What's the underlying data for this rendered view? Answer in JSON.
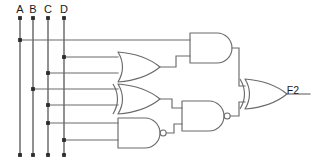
{
  "diagram": {
    "background_color": "#ffffff",
    "wire_color": "#6b6b6b",
    "bus_color": "#5c5c5c",
    "junction_color": "#2b2b2b",
    "text_color": "#1a1a1a"
  },
  "inputs": [
    {
      "label": "A",
      "x": 20,
      "label_x": 20,
      "label_y": 13,
      "top_y": 18,
      "bottom_y": 155
    },
    {
      "label": "B",
      "x": 33,
      "label_x": 33,
      "label_y": 13,
      "top_y": 18,
      "bottom_y": 155
    },
    {
      "label": "C",
      "x": 48,
      "label_x": 48,
      "label_y": 13,
      "top_y": 18,
      "bottom_y": 155
    },
    {
      "label": "D",
      "x": 64,
      "label_x": 64,
      "label_y": 13,
      "top_y": 18,
      "bottom_y": 155
    }
  ],
  "outputs": [
    {
      "label": "F2",
      "x": 293,
      "y": 94
    }
  ],
  "gates": [
    {
      "id": "or1",
      "type": "OR",
      "name": "or-gate-1",
      "x": 118,
      "y": 52,
      "w": 42,
      "h": 30,
      "inputs": [
        "D",
        "C"
      ],
      "bubble": false
    },
    {
      "id": "and1",
      "type": "AND",
      "name": "and-gate-1",
      "x": 190,
      "y": 33,
      "w": 42,
      "h": 30,
      "inputs": [
        "A",
        "or1"
      ],
      "bubble": false
    },
    {
      "id": "xor1",
      "type": "XOR",
      "name": "xor-gate-1",
      "x": 118,
      "y": 84,
      "w": 42,
      "h": 30,
      "inputs": [
        "B",
        "C"
      ],
      "bubble": false
    },
    {
      "id": "nand1",
      "type": "NAND",
      "name": "nand-gate-1",
      "x": 118,
      "y": 118,
      "w": 42,
      "h": 30,
      "inputs": [
        "C",
        "D"
      ],
      "bubble": true
    },
    {
      "id": "nand2",
      "type": "NAND",
      "name": "nand-gate-2",
      "x": 182,
      "y": 101,
      "w": 42,
      "h": 30,
      "inputs": [
        "xor1",
        "nand1"
      ],
      "bubble": true
    },
    {
      "id": "xor2",
      "type": "XOR",
      "name": "xor-gate-2",
      "x": 245,
      "y": 79,
      "w": 42,
      "h": 30,
      "inputs": [
        "and1",
        "nand2"
      ],
      "bubble": false
    }
  ],
  "junctions": [
    {
      "bus": "A",
      "x": 20,
      "y": 40
    },
    {
      "bus": "D",
      "x": 64,
      "y": 57
    },
    {
      "bus": "C",
      "x": 48,
      "y": 73
    },
    {
      "bus": "B",
      "x": 33,
      "y": 89
    },
    {
      "bus": "C",
      "x": 48,
      "y": 105
    },
    {
      "bus": "C",
      "x": 48,
      "y": 123
    },
    {
      "bus": "D",
      "x": 64,
      "y": 140
    },
    {
      "bus": "A",
      "x": 20,
      "y": 18
    },
    {
      "bus": "B",
      "x": 33,
      "y": 18
    },
    {
      "bus": "C",
      "x": 48,
      "y": 18
    },
    {
      "bus": "D",
      "x": 64,
      "y": 18
    },
    {
      "bus": "A",
      "x": 20,
      "y": 155
    },
    {
      "bus": "B",
      "x": 33,
      "y": 155
    },
    {
      "bus": "C",
      "x": 48,
      "y": 155
    },
    {
      "bus": "D",
      "x": 64,
      "y": 155
    }
  ],
  "nets": [
    {
      "name": "A-to-and1-in1",
      "path": "M20,40 L190,40"
    },
    {
      "name": "D-to-or1-in1",
      "path": "M64,57 L118,57"
    },
    {
      "name": "C-to-or1-in2",
      "path": "M48,73 L118,73"
    },
    {
      "name": "B-to-xor1-in1",
      "path": "M33,89 L118,89"
    },
    {
      "name": "C-to-xor1-in2",
      "path": "M48,105 L118,105"
    },
    {
      "name": "C-to-nand1-in1",
      "path": "M48,123 L118,123"
    },
    {
      "name": "D-to-nand1-in2",
      "path": "M64,140 L118,140"
    },
    {
      "name": "or1-to-and1-in2",
      "path": "M160,67 L176,67 L176,56 L190,56"
    },
    {
      "name": "xor1-to-nand2",
      "path": "M160,99 L172,99 L172,108 L182,108"
    },
    {
      "name": "nand1-to-nand2",
      "path": "M165,133 L174,133 L174,124 L182,124"
    },
    {
      "name": "and1-to-xor2",
      "path": "M232,48 L239,48 L239,86 L245,86"
    },
    {
      "name": "nand2-to-xor2",
      "path": "M229,116 L239,116 L239,102 L245,102"
    },
    {
      "name": "xor2-to-F2",
      "path": "M287,94 L310,94"
    }
  ]
}
